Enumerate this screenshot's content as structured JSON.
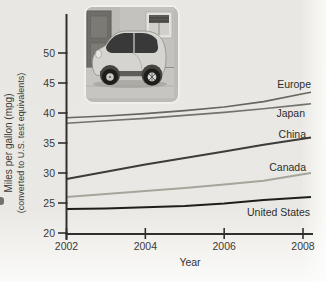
{
  "axes": {
    "ylabel_line1": "Miles per gallon (mpg)",
    "ylabel_line2": "(converted to U.S. test equivalents)"
  },
  "chart_data": {
    "type": "line",
    "x": [
      2002,
      2003,
      2004,
      2005,
      2006,
      2007,
      2008
    ],
    "xticks": [
      "2002",
      "2004",
      "2006",
      "2008"
    ],
    "yticks": [
      20,
      25,
      30,
      35,
      40,
      45,
      50
    ],
    "xlabel": "Year",
    "ylabel": "Miles per gallon (mpg) (converted to U.S. test equivalents)",
    "xlim": [
      2002,
      2008
    ],
    "ylim": [
      20,
      52
    ],
    "grid": false,
    "legend_position": "line-end-labels",
    "series": [
      {
        "name": "Europe",
        "color": "#66655f",
        "values": [
          39.2,
          39.5,
          39.9,
          40.4,
          41.0,
          41.9,
          43.2
        ]
      },
      {
        "name": "Japan",
        "color": "#73726c",
        "values": [
          38.3,
          38.7,
          39.1,
          39.6,
          40.1,
          40.7,
          41.4
        ]
      },
      {
        "name": "China",
        "color": "#3d3c39",
        "values": [
          29.0,
          30.2,
          31.4,
          32.5,
          33.6,
          34.7,
          35.7
        ]
      },
      {
        "name": "Canada",
        "color": "#a6a59b",
        "values": [
          26.0,
          26.5,
          27.0,
          27.5,
          28.1,
          28.7,
          29.8
        ]
      },
      {
        "name": "United States",
        "color": "#1e1e1c",
        "values": [
          24.0,
          24.1,
          24.3,
          24.5,
          24.9,
          25.5,
          25.9
        ]
      }
    ]
  }
}
